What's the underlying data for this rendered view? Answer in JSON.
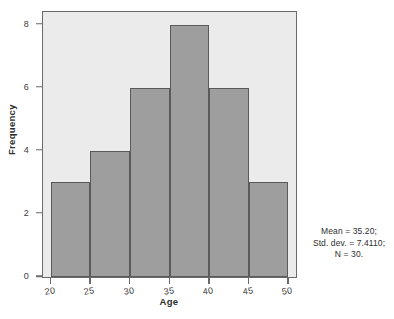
{
  "chart_data": {
    "type": "bar",
    "title": "",
    "subtitle": "",
    "xlabel": "Age",
    "ylabel": "Frequency",
    "categories": [
      "20-25",
      "25-30",
      "30-35",
      "35-40",
      "40-45",
      "45-50"
    ],
    "bin_edges": [
      20,
      25,
      30,
      35,
      40,
      45,
      50
    ],
    "values": [
      3,
      4,
      6,
      8,
      6,
      3
    ],
    "bin_width": 5,
    "xlim": [
      19,
      51
    ],
    "ylim": [
      0,
      8.4
    ],
    "xticks": [
      "20",
      "25",
      "30",
      "35",
      "40",
      "45",
      "50"
    ],
    "xtick_values": [
      20,
      25,
      30,
      35,
      40,
      45,
      50
    ],
    "yticks": [
      "0",
      "2",
      "4",
      "6",
      "8"
    ],
    "ytick_values": [
      0,
      2,
      4,
      6,
      8
    ],
    "grid": false,
    "legend": null,
    "legend_position": "none",
    "annotations": [
      "Mean = 35.20;",
      "Std. dev. = 7.4110;",
      "N = 30."
    ],
    "statistics": {
      "mean": "35.20",
      "std_dev": "7.4110",
      "n": "30"
    },
    "colors": {
      "bar_fill": "#9e9e9e",
      "bar_edge": "#5a5a5a",
      "panel_background": "#ebebeb",
      "figure_background": "#ffffff",
      "axis_line": "#6a6a6a",
      "text": "#2e2e2e"
    }
  }
}
